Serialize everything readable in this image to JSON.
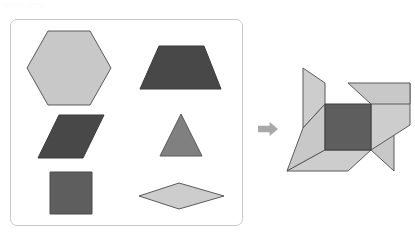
{
  "page": {
    "watermark_text": "www.cnsi",
    "background_color": "#ffffff"
  },
  "palette": {
    "light_gray": "#c8c8c8",
    "light_gray_2": "#cdcdcd",
    "mid_gray": "#808080",
    "mid_dark_gray": "#6b6b6b",
    "dark_gray": "#4a4a4a",
    "square_gray": "#5e5e5e",
    "stroke": "#5a5a5a",
    "panel_border": "#c9c9c9",
    "arrow_gray": "#a8a8a8"
  },
  "parts_panel": {
    "label": "Shape parts tray",
    "border_color": "#c9c9c9",
    "x": 10,
    "y": 19,
    "width": 233,
    "height": 207,
    "shapes": [
      {
        "id": "hexagon",
        "name": "hexagon",
        "fill": "#c8c8c8",
        "stroke": "#5a5a5a",
        "points": "48,31 90,31 111,68 90,105 48,105 27,68"
      },
      {
        "id": "trapezoid",
        "name": "trapezoid",
        "fill": "#484848",
        "stroke": "#3a3a3a",
        "points": "159,46 204,46 221,89 140,89"
      },
      {
        "id": "parallelogram",
        "name": "parallelogram",
        "fill": "#484848",
        "stroke": "#3a3a3a",
        "points": "59,115 104,115 83,158 38,158"
      },
      {
        "id": "triangle",
        "name": "triangle",
        "fill": "#808080",
        "stroke": "#5a5a5a",
        "points": "181,114 202,156 160,156"
      },
      {
        "id": "square",
        "name": "square",
        "fill": "#5e5e5e",
        "stroke": "#4a4a4a",
        "points": "50,172 92,172 92,214 50,214"
      },
      {
        "id": "rhombus",
        "name": "rhombus",
        "fill": "#cdcdcd",
        "stroke": "#5a5a5a",
        "points": "179,183 224,196 179,209 139,196"
      }
    ]
  },
  "arrow": {
    "name": "right-arrow-icon",
    "direction": "right",
    "fill": "#a8a8a8",
    "x": 258,
    "y": 122,
    "width": 20,
    "height": 14
  },
  "assembly": {
    "label": "Assembled pinwheel",
    "center_square": {
      "name": "pinwheel-center-square",
      "fill": "#5e5e5e",
      "stroke": "#3f3f3f",
      "points": "325,104 371,104 371,150 325,150"
    },
    "blades": [
      {
        "id": "blade-top-right",
        "name": "pinwheel-blade-top-right",
        "fill": "#c8c8c8",
        "stroke": "#5a5a5a",
        "points": "371,104 348,83 410,83 410,104"
      },
      {
        "id": "blade-right-lower",
        "name": "pinwheel-blade-right",
        "fill": "#cdcdcd",
        "stroke": "#5a5a5a",
        "points": "371,104 410,83 410,125 371,150"
      },
      {
        "id": "blade-bottom-right",
        "name": "pinwheel-blade-bottom-right",
        "fill": "#c8c8c8",
        "stroke": "#5a5a5a",
        "points": "371,150 394,171 394,130 371,104"
      },
      {
        "id": "blade-bottom-left",
        "name": "pinwheel-blade-bottom-left",
        "fill": "#cdcdcd",
        "stroke": "#5a5a5a",
        "points": "325,150 371,150 348,171 287,171"
      },
      {
        "id": "blade-left-upper",
        "name": "pinwheel-blade-left",
        "fill": "#c8c8c8",
        "stroke": "#5a5a5a",
        "points": "325,104 325,150 287,171 303,128"
      },
      {
        "id": "blade-top-left",
        "name": "pinwheel-blade-top-left",
        "fill": "#cdcdcd",
        "stroke": "#5a5a5a",
        "points": "325,104 303,128 303,68 325,83"
      }
    ]
  }
}
